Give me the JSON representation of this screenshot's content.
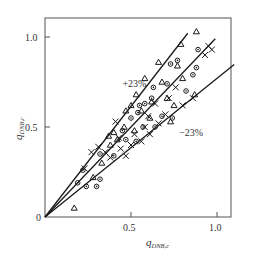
{
  "chart_data": {
    "type": "scatter",
    "title": "",
    "xlabel": "q_{DNB,c}",
    "ylabel": "q_{DNB,r}",
    "xlabel_main": "q",
    "xlabel_sub": "DNB,c",
    "ylabel_main": "q",
    "ylabel_sub": "DNB,r",
    "xlim": [
      0,
      1.1
    ],
    "ylim": [
      0,
      1.1
    ],
    "x_ticks": [
      0.5,
      1.0
    ],
    "x_tick_labels": [
      "0.5",
      "1.0"
    ],
    "y_ticks": [
      0.5,
      1.0
    ],
    "y_tick_labels": [
      "0.5",
      "1.0"
    ],
    "origin_label": "0",
    "grid": false,
    "legend": null,
    "reference_lines": [
      {
        "name": "+23% bound",
        "slope": 1.23,
        "x_end": 0.83
      },
      {
        "name": "1:1 line",
        "slope": 1.0,
        "x_end": 0.99
      },
      {
        "name": "-23% bound",
        "slope": 0.77,
        "x_end": 1.1
      }
    ],
    "annotations": [
      {
        "text": "+23%",
        "x": 0.45,
        "y": 0.72
      },
      {
        "text": "−23%",
        "x": 0.78,
        "y": 0.45
      }
    ],
    "series": [
      {
        "name": "triangles",
        "marker": "triangle",
        "points": [
          [
            0.17,
            0.05
          ],
          [
            0.28,
            0.22
          ],
          [
            0.33,
            0.3
          ],
          [
            0.38,
            0.4
          ],
          [
            0.37,
            0.45
          ],
          [
            0.4,
            0.47
          ],
          [
            0.42,
            0.43
          ],
          [
            0.46,
            0.5
          ],
          [
            0.47,
            0.59
          ],
          [
            0.5,
            0.62
          ],
          [
            0.52,
            0.48
          ],
          [
            0.53,
            0.68
          ],
          [
            0.56,
            0.59
          ],
          [
            0.58,
            0.77
          ],
          [
            0.61,
            0.55
          ],
          [
            0.62,
            0.64
          ],
          [
            0.66,
            0.86
          ],
          [
            0.68,
            0.75
          ],
          [
            0.71,
            0.66
          ],
          [
            0.73,
            0.53
          ],
          [
            0.75,
            0.62
          ],
          [
            0.77,
            0.84
          ],
          [
            0.79,
            0.96
          ],
          [
            0.8,
            0.77
          ],
          [
            0.87,
            0.68
          ],
          [
            0.88,
            1.03
          ]
        ]
      },
      {
        "name": "circles",
        "marker": "circle",
        "points": [
          [
            0.19,
            0.19
          ],
          [
            0.22,
            0.26
          ],
          [
            0.24,
            0.17
          ],
          [
            0.3,
            0.17
          ],
          [
            0.32,
            0.21
          ],
          [
            0.32,
            0.35
          ],
          [
            0.4,
            0.34
          ],
          [
            0.45,
            0.48
          ],
          [
            0.47,
            0.43
          ],
          [
            0.5,
            0.55
          ],
          [
            0.53,
            0.42
          ],
          [
            0.54,
            0.58
          ],
          [
            0.55,
            0.62
          ],
          [
            0.57,
            0.5
          ],
          [
            0.58,
            0.63
          ],
          [
            0.62,
            0.66
          ],
          [
            0.63,
            0.72
          ],
          [
            0.64,
            0.5
          ],
          [
            0.68,
            0.56
          ],
          [
            0.71,
            0.74
          ],
          [
            0.73,
            0.85
          ],
          [
            0.74,
            0.55
          ],
          [
            0.77,
            0.87
          ],
          [
            0.82,
            0.7
          ],
          [
            0.86,
            0.79
          ],
          [
            0.88,
            0.83
          ],
          [
            0.89,
            0.93
          ]
        ]
      },
      {
        "name": "crosses",
        "marker": "cross",
        "points": [
          [
            0.23,
            0.27
          ],
          [
            0.27,
            0.36
          ],
          [
            0.31,
            0.39
          ],
          [
            0.35,
            0.36
          ],
          [
            0.38,
            0.33
          ],
          [
            0.41,
            0.53
          ],
          [
            0.43,
            0.44
          ],
          [
            0.44,
            0.38
          ],
          [
            0.47,
            0.34
          ],
          [
            0.5,
            0.4
          ],
          [
            0.52,
            0.46
          ],
          [
            0.56,
            0.42
          ],
          [
            0.58,
            0.5
          ],
          [
            0.6,
            0.56
          ],
          [
            0.61,
            0.46
          ],
          [
            0.64,
            0.63
          ],
          [
            0.66,
            0.52
          ],
          [
            0.7,
            0.57
          ],
          [
            0.72,
            0.66
          ],
          [
            0.76,
            0.72
          ],
          [
            0.8,
            0.62
          ],
          [
            0.86,
            0.66
          ],
          [
            0.93,
            0.9
          ],
          [
            0.95,
            0.95
          ],
          [
            0.97,
            0.93
          ]
        ]
      }
    ]
  },
  "layout": {
    "origin_px": [
      45,
      217
    ],
    "px_per_unit_x": 172,
    "px_per_unit_y": 180,
    "frame_px": [
      45,
      18,
      231,
      217
    ]
  }
}
